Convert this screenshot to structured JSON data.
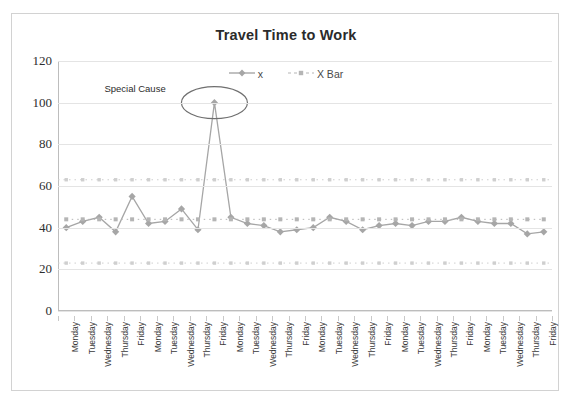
{
  "chart_data": {
    "type": "line",
    "title": "Travel Time to Work",
    "xlabel": "",
    "ylabel": "",
    "ylim": [
      0,
      120
    ],
    "ytick_step": 20,
    "yticks": [
      "0",
      "20",
      "40",
      "60",
      "80",
      "100",
      "120"
    ],
    "grid": true,
    "legend_position": "top-center",
    "categories": [
      "Monday",
      "Tuesday",
      "Wednesday",
      "Thursday",
      "Friday",
      "Monday",
      "Tuesday",
      "Wednesday",
      "Thursday",
      "Friday",
      "Monday",
      "Tuesday",
      "Wednesday",
      "Thursday",
      "Friday",
      "Monday",
      "Tuesday",
      "Wednesday",
      "Thursday",
      "Friday",
      "Monday",
      "Tuesday",
      "Wednesday",
      "Thursday",
      "Friday",
      "Monday",
      "Tuesday",
      "Wednesday",
      "Thursday",
      "Friday"
    ],
    "series": [
      {
        "name": "x",
        "marker": "diamond",
        "linestyle": "solid",
        "color": "#a6a6a6",
        "values": [
          40,
          43,
          45,
          38,
          55,
          42,
          43,
          49,
          39,
          100,
          45,
          42,
          41,
          38,
          39,
          40,
          45,
          43,
          39,
          41,
          42,
          41,
          43,
          43,
          45,
          43,
          42,
          42,
          37,
          38
        ]
      },
      {
        "name": "X Bar",
        "marker": "square",
        "linestyle": "dotted",
        "color": "#b5b5b5",
        "values": [
          44,
          44,
          44,
          44,
          44,
          44,
          44,
          44,
          44,
          44,
          44,
          44,
          44,
          44,
          44,
          44,
          44,
          44,
          44,
          44,
          44,
          44,
          44,
          44,
          44,
          44,
          44,
          44,
          44,
          44
        ]
      }
    ],
    "control_limits": {
      "upper": 63,
      "lower": 23,
      "style": "dotted",
      "color": "#cfcfcf"
    },
    "annotations": [
      {
        "text": "Special Cause",
        "target_index": 9,
        "target_value": 100
      }
    ]
  },
  "legend": {
    "items": [
      {
        "label": "x"
      },
      {
        "label": "X Bar"
      }
    ]
  },
  "colors": {
    "series_x": "#a6a6a6",
    "series_xbar": "#b5b5b5",
    "grid": "#e4e4e4",
    "axis": "#bdbdbd",
    "text": "#2b2b2b",
    "border": "#d2d2d2"
  }
}
